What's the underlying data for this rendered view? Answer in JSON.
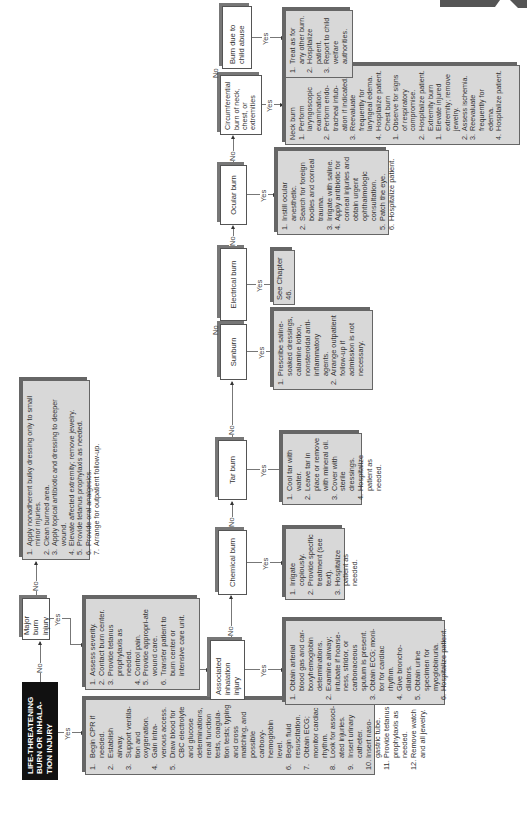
{
  "connectors": {
    "yes": "Yes",
    "no": "No"
  },
  "nodes": {
    "life_threatening": {
      "label": "LIFE-THREATENING BURN OR INHALA-TION INJURY"
    },
    "major_burn": {
      "label": "Major burn injury"
    },
    "associated_inhalation": {
      "label": "Associated inhalation injury"
    },
    "chemical_burn": {
      "label": "Chemical burn"
    },
    "tar_burn": {
      "label": "Tar burn"
    },
    "sunburn": {
      "label": "Sunburn"
    },
    "electrical_burn": {
      "label": "Electrical burn"
    },
    "ocular_burn": {
      "label": "Ocular burn"
    },
    "circumferential_burn": {
      "label": "Circumferential burn of neck, chest, or extremities"
    },
    "child_abuse_burn": {
      "label": "Burn due to child abuse"
    }
  },
  "actions": {
    "life_threatening_yes": [
      {
        "n": "1.",
        "t": "Begin CPR if needed."
      },
      {
        "n": "2.",
        "t": "Establish airway."
      },
      {
        "n": "3.",
        "t": "Support ventila-tion and oxygenation."
      },
      {
        "n": "4.",
        "t": "Gain intra-venous access."
      },
      {
        "n": "5.",
        "t": "Draw blood for CBC electrolyte and glucose determinations, renal function tests, coagula-tion tests; typing and cross matching, and possible carboxy-hemoglobin level."
      },
      {
        "n": "6.",
        "t": "Begin fluid resuscitation."
      },
      {
        "n": "7.",
        "t": "Obtain ECG; monitor cardiac rhythm."
      },
      {
        "n": "8.",
        "t": "Look for associ-ated injuries."
      },
      {
        "n": "9.",
        "t": "Insert urinary catheter."
      },
      {
        "n": "10.",
        "t": "Insert naso-gastric tube."
      },
      {
        "n": "11.",
        "t": "Provide tetanus prophylaxis as needed."
      },
      {
        "n": "12.",
        "t": "Remove watch and all jewelry."
      }
    ],
    "major_burn_no": [
      {
        "n": "1.",
        "t": "Apply nonadherent bulky dressing only to small minor injuries."
      },
      {
        "n": "2.",
        "t": "Clean burned area."
      },
      {
        "n": "3.",
        "t": "Apply topical antibiotic and dressing to deeper wound."
      },
      {
        "n": "4.",
        "t": "Elevate affected extremity; remove jewelry."
      },
      {
        "n": "5.",
        "t": "Provide tetanus prophylaxis as needed."
      },
      {
        "n": "6.",
        "t": "Provide oral analgesics."
      },
      {
        "n": "7.",
        "t": "Arrange for outpatient follow-up."
      }
    ],
    "major_burn_yes": [
      {
        "n": "1.",
        "t": "Assess severity."
      },
      {
        "n": "2.",
        "t": "Contact burn center."
      },
      {
        "n": "3.",
        "t": "Provide tetanus prophylaxis as needed."
      },
      {
        "n": "4.",
        "t": "Control pain."
      },
      {
        "n": "5.",
        "t": "Provide appropri-ate wound care."
      },
      {
        "n": "6.",
        "t": "Transfer patient to burn center or intensive care unit."
      }
    ],
    "inhalation_yes": [
      {
        "n": "1.",
        "t": "Obtain arterial blood gas and car-boxyhemoglobin determinations."
      },
      {
        "n": "2.",
        "t": "Examine airway; intubate if hoarse-ness, stridor, or carbonaceous sputum is present."
      },
      {
        "n": "3.",
        "t": "Obtain ECG; moni-tor for cardiac rhythm."
      },
      {
        "n": "4.",
        "t": "Give broncho-dilators."
      },
      {
        "n": "5.",
        "t": "Obtain urine specimen for myoglobinuria."
      },
      {
        "n": "6.",
        "t": "Hospitalize patient."
      }
    ],
    "chemical_yes": [
      {
        "n": "1.",
        "t": "Irrigate copiously."
      },
      {
        "n": "2.",
        "t": "Provide specific treatment (see text)."
      },
      {
        "n": "3.",
        "t": "Hospitalize patient as needed."
      }
    ],
    "tar_yes": [
      {
        "n": "1.",
        "t": "Cool tar with water."
      },
      {
        "n": "2.",
        "t": "Leave tar in place or remove with mineral oil."
      },
      {
        "n": "3.",
        "t": "Cover with sterile dressings."
      },
      {
        "n": "4.",
        "t": "Hospitalize patient as needed."
      }
    ],
    "sunburn_yes": [
      {
        "n": "1.",
        "t": "Prescribe saline-soaked dressings, calamine lotion, nonsteroidal anti-inflammatory agents."
      },
      {
        "n": "2.",
        "t": "Arrange outpatient follow-up if admission is not necessary."
      }
    ],
    "electrical_yes": "See Chapter 46.",
    "ocular_yes": [
      {
        "n": "1.",
        "t": "Instill ocular anesthetic."
      },
      {
        "n": "2.",
        "t": "Search for foreign bodies and corneal trauma."
      },
      {
        "n": "3.",
        "t": "Irrigate with saline."
      },
      {
        "n": "4.",
        "t": "Apply antibiotic for corneal injuries and obtain urgent ophthalmologic consultation."
      },
      {
        "n": "5.",
        "t": "Patch the eye."
      },
      {
        "n": "6.",
        "t": "Hospitalize patient."
      }
    ],
    "circumferential_yes": {
      "neck_heading": "Neck burn",
      "neck": [
        {
          "n": "1.",
          "t": "Perform laryngoscopic examination."
        },
        {
          "n": "2.",
          "t": "Perform endo-tracheal intub-ation if indicated."
        },
        {
          "n": "3.",
          "t": "Reevaluate frequently for laryngeal edema."
        },
        {
          "n": "4.",
          "t": "Hospitalize patient."
        }
      ],
      "chest_heading": "Chest burn",
      "chest": [
        {
          "n": "1.",
          "t": "Observe for signs of respiratory compromise."
        },
        {
          "n": "2.",
          "t": "Hospitalize patient."
        }
      ],
      "extremity_heading": "Extremity burn",
      "extremity": [
        {
          "n": "1.",
          "t": "Elevate injured extremity; remove jewelry."
        },
        {
          "n": "2.",
          "t": "Assess ischemia."
        },
        {
          "n": "3.",
          "t": "Reevaluate frequently for edema."
        },
        {
          "n": "4.",
          "t": "Hospitalize patient."
        }
      ]
    },
    "child_abuse_yes": [
      {
        "n": "1.",
        "t": "Treat as for any other burn."
      },
      {
        "n": "2.",
        "t": "Hospitalize patient."
      },
      {
        "n": "3.",
        "t": "Report to child welfare authorities."
      }
    ]
  },
  "colors": {
    "action_fill": "#d8d8d8",
    "header_fill": "#111111",
    "line": "#777777"
  }
}
